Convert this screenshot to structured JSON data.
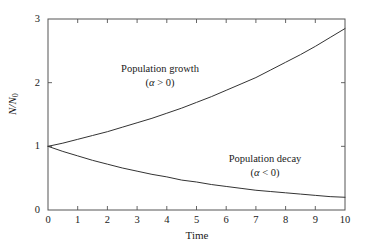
{
  "chart_data": {
    "type": "line",
    "title": "",
    "xlabel": "Time",
    "ylabel": "N/N0",
    "ylabel_main": "N/N",
    "ylabel_sub": "0",
    "xlim": [
      0,
      10
    ],
    "ylim": [
      0,
      3
    ],
    "xticks": [
      0,
      1,
      2,
      3,
      4,
      5,
      6,
      7,
      8,
      9,
      10
    ],
    "xtick_labels": [
      "0",
      "1",
      "2",
      "3",
      "4",
      "5",
      "6",
      "7",
      "8",
      "9",
      "10"
    ],
    "yticks": [
      0,
      1,
      2,
      3
    ],
    "ytick_labels": [
      "0",
      "1",
      "2",
      "3"
    ],
    "grid": false,
    "legend_position": "none",
    "frame": "box",
    "tick_direction": "in",
    "line_color": "#333333",
    "axis_color": "#555555",
    "background_color": "#ffffff",
    "x": [
      0,
      0.5,
      1,
      1.5,
      2,
      2.5,
      3,
      3.5,
      4,
      4.5,
      5,
      5.5,
      6,
      6.5,
      7,
      7.5,
      8,
      8.5,
      9,
      9.5,
      10
    ],
    "series": [
      {
        "name": "Population growth",
        "alpha_sign": "positive",
        "annotation_line1": "Population growth",
        "annotation_line2_prefix": "(",
        "annotation_line2_symbol": "α",
        "annotation_line2_relation": " > 0)",
        "values": [
          1.0,
          1.05,
          1.11,
          1.17,
          1.23,
          1.3,
          1.37,
          1.44,
          1.52,
          1.6,
          1.69,
          1.78,
          1.88,
          1.98,
          2.08,
          2.2,
          2.32,
          2.44,
          2.57,
          2.71,
          2.85
        ]
      },
      {
        "name": "Population decay",
        "alpha_sign": "negative",
        "annotation_line1": "Population decay",
        "annotation_line2_prefix": "(",
        "annotation_line2_symbol": "α",
        "annotation_line2_relation": " < 0)",
        "values": [
          1.0,
          0.92,
          0.85,
          0.78,
          0.72,
          0.66,
          0.61,
          0.56,
          0.52,
          0.47,
          0.44,
          0.4,
          0.37,
          0.34,
          0.31,
          0.29,
          0.27,
          0.25,
          0.23,
          0.21,
          0.2
        ]
      }
    ],
    "annotations": [
      {
        "id": "growth",
        "line1": "Population growth",
        "symbol": "α",
        "line2_before": "(",
        "line2_after": " > 0)"
      },
      {
        "id": "decay",
        "line1": "Population decay",
        "symbol": "α",
        "line2_before": "(",
        "line2_after": " < 0)"
      }
    ]
  }
}
